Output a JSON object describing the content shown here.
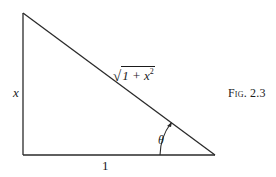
{
  "figure": {
    "caption": "Fig. 2.3",
    "type": "right triangle",
    "vertices": {
      "top_left": [
        23,
        13
      ],
      "bottom_left": [
        23,
        155
      ],
      "bottom_right": [
        215,
        155
      ]
    },
    "labels": {
      "vertical_side": "x",
      "horizontal_side": "1",
      "hypotenuse_sqrt": "√",
      "hypotenuse_radicand_base": "1 + x",
      "hypotenuse_radicand_exp": "2",
      "angle": "θ"
    },
    "colors": {
      "stroke": "#2a2a2a",
      "background": "#ffffff"
    }
  }
}
